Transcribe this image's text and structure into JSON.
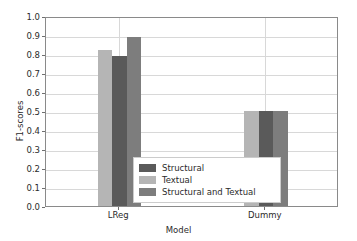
{
  "chart_data": {
    "type": "bar",
    "title": "",
    "xlabel": "Model",
    "ylabel": "F1-scores",
    "categories": [
      "LReg",
      "Dummy"
    ],
    "ylim": [
      0.0,
      1.0
    ],
    "ytick_labels": [
      "0.0",
      "0.1",
      "0.2",
      "0.3",
      "0.4",
      "0.5",
      "0.6",
      "0.7",
      "0.8",
      "0.9",
      "1.0"
    ],
    "ytick_values": [
      0.0,
      0.1,
      0.2,
      0.3,
      0.4,
      0.5,
      0.6,
      0.7,
      0.8,
      0.9,
      1.0
    ],
    "grid": true,
    "legend_position": "center",
    "series": [
      {
        "name": "Structural",
        "color": "#5a5a5a",
        "values": [
          0.79,
          0.5
        ],
        "plot_order": 2
      },
      {
        "name": "Textual",
        "color": "#b5b5b5",
        "values": [
          0.82,
          0.5
        ],
        "plot_order": 1
      },
      {
        "name": "Structural and Textual",
        "color": "#7d7d7d",
        "values": [
          0.89,
          0.5
        ],
        "plot_order": 3
      }
    ],
    "bars_in_draw_order": [
      {
        "category": "LReg",
        "series": "Textual",
        "value": 0.82,
        "color": "#b5b5b5"
      },
      {
        "category": "LReg",
        "series": "Structural",
        "value": 0.79,
        "color": "#5a5a5a"
      },
      {
        "category": "LReg",
        "series": "Structural and Textual",
        "value": 0.89,
        "color": "#7d7d7d"
      },
      {
        "category": "Dummy",
        "series": "Textual",
        "value": 0.5,
        "color": "#b5b5b5"
      },
      {
        "category": "Dummy",
        "series": "Structural",
        "value": 0.5,
        "color": "#5a5a5a"
      },
      {
        "category": "Dummy",
        "series": "Structural and Textual",
        "value": 0.5,
        "color": "#7d7d7d"
      }
    ]
  },
  "axis": {
    "ylabel": "F1-scores",
    "xlabel": "Model",
    "ytick_0": "0.0",
    "ytick_1": "0.1",
    "ytick_2": "0.2",
    "ytick_3": "0.3",
    "ytick_4": "0.4",
    "ytick_5": "0.5",
    "ytick_6": "0.6",
    "ytick_7": "0.7",
    "ytick_8": "0.8",
    "ytick_9": "0.9",
    "ytick_10": "1.0",
    "xtick_0": "LReg",
    "xtick_1": "Dummy"
  },
  "legend": {
    "items": [
      {
        "label": "Structural",
        "color": "#5a5a5a"
      },
      {
        "label": "Textual",
        "color": "#b5b5b5"
      },
      {
        "label": "Structural and Textual",
        "color": "#7d7d7d"
      }
    ]
  },
  "colors": {
    "structural": "#5a5a5a",
    "textual": "#b5b5b5",
    "structural_and_textual": "#7d7d7d",
    "gridline": "#d8d8d8",
    "axis_border": "#8a8a8a",
    "background": "#ffffff",
    "text": "#2b2b2b"
  }
}
